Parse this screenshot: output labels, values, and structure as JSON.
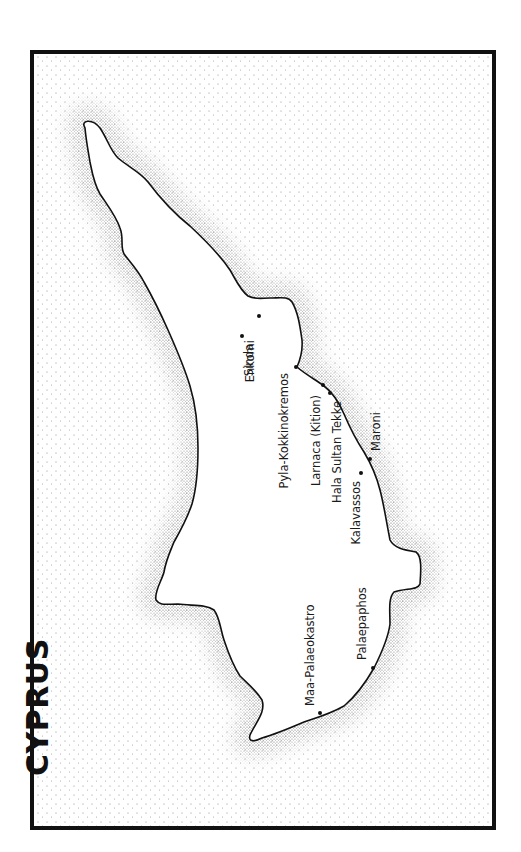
{
  "map": {
    "title": "CYPRUS",
    "colors": {
      "frame": "#111111",
      "land": "#ffffff",
      "coastline": "#111111",
      "sea_stipple": "#555555",
      "pin": "#111111",
      "label": "#1a1a1a"
    },
    "sites": [
      {
        "name": "Enkomi",
        "x": 259,
        "y": 316
      },
      {
        "name": "Sinda",
        "x": 242,
        "y": 336
      },
      {
        "name": "Pyla-Kokkinokremos",
        "x": 296,
        "y": 367
      },
      {
        "name": "Larnaca (Kition)",
        "x": 323,
        "y": 385
      },
      {
        "name": "Hala Sultan Tekke",
        "x": 330,
        "y": 393
      },
      {
        "name": "Maroni",
        "x": 370,
        "y": 459
      },
      {
        "name": "Kalavassos",
        "x": 361,
        "y": 473
      },
      {
        "name": "Palaepaphos",
        "x": 373,
        "y": 668
      },
      {
        "name": "Maa-Palaeokastro",
        "x": 320,
        "y": 713
      }
    ]
  }
}
